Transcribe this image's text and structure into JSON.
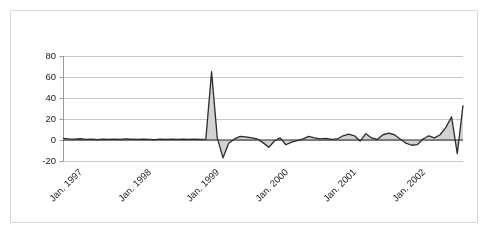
{
  "chart_data": {
    "type": "area",
    "title": "",
    "subtitle": "",
    "xlabel": "",
    "ylabel": "",
    "ylim": [
      -20,
      80
    ],
    "yticks": [
      -20,
      0,
      20,
      40,
      60,
      80
    ],
    "ytick_labels": [
      "-20",
      "0",
      "20",
      "40",
      "60",
      "80"
    ],
    "grid": true,
    "legend": false,
    "legend_position": "none",
    "xtick_labels": [
      "Jan. 1997",
      "Jan. 1998",
      "Jan. 1999",
      "Jan. 2000",
      "Jan. 2001",
      "Jan. 2002"
    ],
    "xtick_indices": [
      0,
      12,
      24,
      36,
      48,
      60
    ],
    "series": [
      {
        "name": "series-1",
        "line_color": "#2b2b2b",
        "fill_color": "#d2d2d2",
        "values": [
          1.5,
          1.0,
          0.8,
          1.2,
          0.6,
          0.9,
          0.4,
          0.7,
          0.5,
          0.8,
          0.6,
          1.0,
          0.7,
          0.5,
          0.9,
          0.6,
          0.4,
          0.8,
          0.5,
          0.7,
          0.6,
          0.9,
          0.5,
          0.8,
          0.6,
          0.9,
          65.0,
          2.0,
          -17.0,
          -3.0,
          1.0,
          3.5,
          3.0,
          2.0,
          1.0,
          -2.5,
          -7.0,
          -1.0,
          2.0,
          -4.5,
          -2.0,
          -0.5,
          1.0,
          3.5,
          2.0,
          1.0,
          1.5,
          0.5,
          1.0,
          4.0,
          5.5,
          4.0,
          -1.0,
          6.0,
          2.0,
          0.5,
          5.0,
          6.5,
          5.0,
          1.0,
          -3.0,
          -5.0,
          -4.5,
          1.0,
          4.0,
          2.0,
          5.0,
          12.0,
          22.0,
          -13.0,
          33.0
        ]
      }
    ]
  }
}
